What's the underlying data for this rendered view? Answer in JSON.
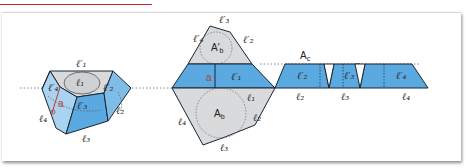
{
  "header": {
    "title": ""
  },
  "colors": {
    "face_blue": "#5aa9e0",
    "face_blue_light": "#a9d3f0",
    "face_blue_mid": "#7fbde8",
    "base_gray": "#d9dadc",
    "edge": "#1a2433",
    "dotted": "#6b6b6b",
    "accent_red": "#c0392b",
    "header_underline": "#c0272d"
  },
  "figures": {
    "solid": {
      "labels": {
        "top_edge_1": "ℓ′₁",
        "top_base": "ℓ₁",
        "top_edge_4": "ℓ′₄",
        "top_edge_2": "ℓ′₂",
        "apothem": "a",
        "face_3_top": "ℓ′₃",
        "bottom_edge_4": "ℓ₄",
        "bottom_edge_2": "ℓ₂",
        "bottom_edge_3": "ℓ₃"
      }
    },
    "net_bases": {
      "labels": {
        "top_base_edge_3": "ℓ′₃",
        "top_base_edge_4": "ℓ′₄",
        "top_base_edge_2": "ℓ′₂",
        "top_base_area": "A′",
        "top_base_area_sub": "b",
        "apothem": "a",
        "face_1_top": "ℓ′₁",
        "bottom_edge_1": "ℓ₁",
        "bottom_edge_2": "ℓ₂",
        "bottom_edge_4": "ℓ₄",
        "bottom_edge_3": "ℓ₃",
        "bottom_base_area": "A",
        "bottom_base_area_sub": "b"
      }
    },
    "net_lateral": {
      "labels": {
        "lateral_area": "A",
        "lateral_area_sub": "c",
        "face_2_top": "ℓ′₂",
        "face_3_top": "ℓ′₃",
        "face_4_top": "ℓ′₄",
        "face_2_bottom": "ℓ₂",
        "face_3_bottom": "ℓ₃",
        "face_4_bottom": "ℓ₄"
      }
    }
  }
}
